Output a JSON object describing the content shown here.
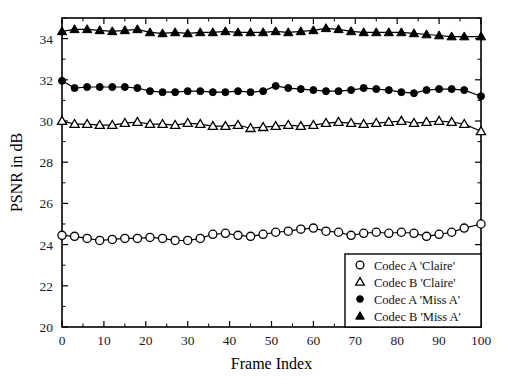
{
  "chart_data": {
    "type": "line",
    "title": "",
    "xlabel": "Frame Index",
    "ylabel": "PSNR in dB",
    "xlim": [
      0,
      100
    ],
    "ylim": [
      20,
      35
    ],
    "xticks": [
      0,
      10,
      20,
      30,
      40,
      50,
      60,
      70,
      80,
      90,
      100
    ],
    "xtick_labels": [
      "0",
      "10",
      "20",
      "30",
      "40",
      "50",
      "60",
      "70",
      "80",
      "90",
      "100"
    ],
    "yticks": [
      20,
      22,
      24,
      26,
      28,
      30,
      32,
      34
    ],
    "ytick_labels": [
      "20",
      "22",
      "24",
      "26",
      "28",
      "30",
      "32",
      "34"
    ],
    "grid": false,
    "legend_position": "lower right",
    "x": [
      0,
      3,
      6,
      9,
      12,
      15,
      18,
      21,
      24,
      27,
      30,
      33,
      36,
      39,
      42,
      45,
      48,
      51,
      54,
      57,
      60,
      63,
      66,
      69,
      72,
      75,
      78,
      81,
      84,
      87,
      90,
      93,
      96,
      100
    ],
    "series": [
      {
        "name": "Codec A 'Claire'",
        "marker": "open-circle",
        "values": [
          24.45,
          24.4,
          24.3,
          24.2,
          24.25,
          24.3,
          24.3,
          24.35,
          24.3,
          24.2,
          24.2,
          24.3,
          24.5,
          24.55,
          24.45,
          24.4,
          24.5,
          24.6,
          24.65,
          24.75,
          24.8,
          24.65,
          24.6,
          24.45,
          24.55,
          24.6,
          24.55,
          24.6,
          24.55,
          24.4,
          24.5,
          24.6,
          24.8,
          25.0
        ]
      },
      {
        "name": "Codec B 'Claire'",
        "marker": "open-triangle",
        "values": [
          30.0,
          29.85,
          29.85,
          29.8,
          29.8,
          29.9,
          29.95,
          29.85,
          29.85,
          29.8,
          29.9,
          29.85,
          29.75,
          29.75,
          29.8,
          29.65,
          29.7,
          29.75,
          29.8,
          29.75,
          29.8,
          29.9,
          29.95,
          29.9,
          29.85,
          29.9,
          29.95,
          30.0,
          29.9,
          29.95,
          30.0,
          29.95,
          29.85,
          29.5
        ]
      },
      {
        "name": "Codec A 'Miss A'",
        "marker": "filled-circle",
        "values": [
          31.95,
          31.6,
          31.65,
          31.65,
          31.65,
          31.65,
          31.6,
          31.45,
          31.4,
          31.4,
          31.45,
          31.45,
          31.4,
          31.4,
          31.45,
          31.4,
          31.45,
          31.7,
          31.6,
          31.55,
          31.5,
          31.45,
          31.45,
          31.5,
          31.6,
          31.55,
          31.5,
          31.4,
          31.35,
          31.5,
          31.55,
          31.55,
          31.5,
          31.2
        ]
      },
      {
        "name": "Codec B 'Miss A'",
        "marker": "filled-triangle",
        "values": [
          34.35,
          34.45,
          34.45,
          34.4,
          34.35,
          34.4,
          34.45,
          34.3,
          34.25,
          34.3,
          34.25,
          34.3,
          34.3,
          34.35,
          34.3,
          34.3,
          34.3,
          34.35,
          34.3,
          34.35,
          34.4,
          34.5,
          34.45,
          34.35,
          34.3,
          34.3,
          34.3,
          34.3,
          34.25,
          34.2,
          34.15,
          34.1,
          34.1,
          34.1
        ]
      }
    ]
  },
  "legend": {
    "entries": [
      {
        "label": "Codec A 'Claire'",
        "marker": "open-circle"
      },
      {
        "label": "Codec B 'Claire'",
        "marker": "open-triangle"
      },
      {
        "label": "Codec A 'Miss A'",
        "marker": "filled-circle"
      },
      {
        "label": "Codec B 'Miss A'",
        "marker": "filled-triangle"
      }
    ]
  },
  "colors": {
    "foreground": "#000000",
    "background": "#ffffff"
  }
}
